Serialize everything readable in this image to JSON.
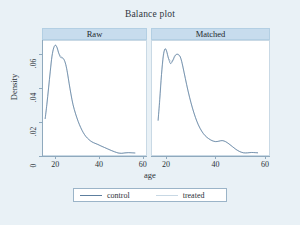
{
  "chart_data": {
    "type": "line",
    "title": "Balance plot",
    "xlabel": "age",
    "ylabel": "Density",
    "xlim": [
      14,
      62
    ],
    "ylim": [
      0,
      0.068
    ],
    "xticks": [
      20,
      40,
      60
    ],
    "xtick_labels": [
      "20",
      "40",
      "60"
    ],
    "yticks": [
      0,
      0.02,
      0.04,
      0.06
    ],
    "ytick_labels": [
      "0",
      ".02",
      ".04",
      ".06"
    ],
    "grid": false,
    "legend_position": "bottom",
    "line_color": "#5d7f9f",
    "panel_header_color": "#c7dced",
    "background_color": "#e9f1f6",
    "plot_background_color": "#ffffff",
    "panels": [
      {
        "label": "Raw",
        "series": [
          {
            "name": "control",
            "x": [
              15.0,
              15.8,
              16.6,
              17.4,
              18.2,
              19.0,
              19.8,
              20.6,
              21.4,
              22.2,
              23.0,
              23.8,
              24.6,
              25.4,
              26.2,
              27.0,
              28.0,
              29.2,
              30.4,
              31.6,
              32.8,
              34.0,
              35.4,
              36.8,
              38.2,
              39.6,
              41.0,
              42.6,
              44.2,
              45.8,
              47.4,
              49.0,
              50.6,
              52.2,
              53.8,
              55.4,
              57.0
            ],
            "y": [
              0.0215,
              0.03,
              0.04,
              0.05,
              0.059,
              0.064,
              0.0655,
              0.064,
              0.0605,
              0.0582,
              0.058,
              0.057,
              0.054,
              0.049,
              0.0425,
              0.0365,
              0.03,
              0.0245,
              0.02,
              0.0163,
              0.0133,
              0.011,
              0.0092,
              0.0078,
              0.007,
              0.0063,
              0.0054,
              0.0045,
              0.0036,
              0.0027,
              0.0019,
              0.0012,
              0.001,
              0.0013,
              0.0014,
              0.0013,
              0.0012
            ]
          },
          {
            "name": "treated",
            "x": [
              15.0,
              16.6,
              18.2,
              19.8,
              21.4,
              23.0,
              24.6,
              26.2,
              28.0,
              30.4,
              32.8,
              35.4,
              38.2,
              41.0,
              44.2,
              47.4,
              50.6,
              53.8,
              57.0
            ],
            "y": [
              0.0215,
              0.04,
              0.059,
              0.0655,
              0.0605,
              0.058,
              0.054,
              0.0425,
              0.03,
              0.02,
              0.0133,
              0.0092,
              0.007,
              0.0054,
              0.0036,
              0.0019,
              0.001,
              0.0014,
              0.0012
            ]
          }
        ]
      },
      {
        "label": "Matched",
        "series": [
          {
            "name": "control",
            "x": [
              16.5,
              17.2,
              17.9,
              18.6,
              19.3,
              20.0,
              20.8,
              21.6,
              22.4,
              23.2,
              24.0,
              24.8,
              25.6,
              26.4,
              27.2,
              28.2,
              29.4,
              30.6,
              31.8,
              33.0,
              34.4,
              35.8,
              37.2,
              38.6,
              40.0,
              41.4,
              42.8,
              44.2,
              45.6,
              47.0,
              48.4,
              50.0,
              51.6,
              53.2,
              54.8,
              56.4,
              57.5
            ],
            "y": [
              0.0205,
              0.033,
              0.048,
              0.059,
              0.0632,
              0.062,
              0.0575,
              0.0545,
              0.056,
              0.0588,
              0.06,
              0.0598,
              0.0585,
              0.0545,
              0.049,
              0.042,
              0.0345,
              0.028,
              0.0225,
              0.018,
              0.0142,
              0.0115,
              0.0098,
              0.0086,
              0.008,
              0.0082,
              0.0086,
              0.008,
              0.0066,
              0.005,
              0.0034,
              0.002,
              0.0013,
              0.0013,
              0.0015,
              0.0014,
              0.0013
            ]
          },
          {
            "name": "treated",
            "x": [
              16.5,
              17.9,
              19.3,
              20.8,
              22.4,
              24.0,
              25.6,
              27.2,
              29.4,
              31.8,
              34.4,
              37.2,
              40.0,
              42.8,
              45.6,
              48.4,
              51.6,
              54.8,
              57.5
            ],
            "y": [
              0.0205,
              0.048,
              0.0632,
              0.0575,
              0.056,
              0.06,
              0.0585,
              0.049,
              0.0345,
              0.0225,
              0.0142,
              0.0098,
              0.008,
              0.0086,
              0.0066,
              0.0034,
              0.0013,
              0.0015,
              0.0013
            ]
          }
        ]
      }
    ],
    "legend": [
      {
        "label": "control",
        "marker": "line",
        "color": "#5d7f9f"
      },
      {
        "label": "treated",
        "marker": "line",
        "color": "#c8d8e4"
      }
    ]
  }
}
